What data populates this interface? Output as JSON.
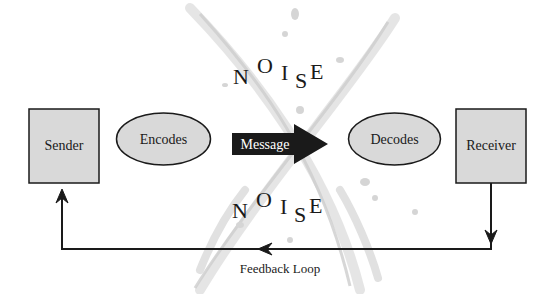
{
  "diagram": {
    "nodes": {
      "sender": {
        "label": "Sender",
        "shape": "box"
      },
      "encodes": {
        "label": "Encodes",
        "shape": "ellipse"
      },
      "message": {
        "label": "Message",
        "shape": "arrow"
      },
      "decodes": {
        "label": "Decodes",
        "shape": "ellipse"
      },
      "receiver": {
        "label": "Receiver",
        "shape": "box"
      }
    },
    "noise_top": {
      "letters": [
        "N",
        "O",
        "I",
        "S",
        "E"
      ]
    },
    "noise_bottom": {
      "letters": [
        "N",
        "O",
        "I",
        "S",
        "E"
      ]
    },
    "feedback": {
      "label": "Feedback Loop",
      "from": "receiver",
      "to": "sender"
    },
    "colors": {
      "box_fill": "#d9d9d9",
      "ellipse_fill": "#d9d9d9",
      "stroke": "#1a1a1a",
      "message_fill": "#1a1a1a",
      "message_text": "#ffffff",
      "noise_splatter": "#c8c8c8"
    }
  }
}
